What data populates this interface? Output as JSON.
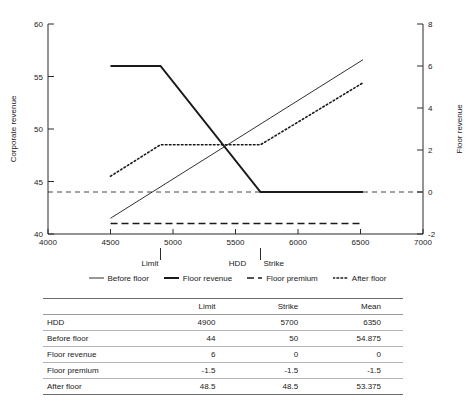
{
  "chart_data": {
    "type": "line",
    "title": "",
    "xlabel": "HDD",
    "ylabel": "Corporate revenue",
    "y2label": "Floor revenue",
    "xlim": [
      4000,
      7000
    ],
    "ylim": [
      40,
      60
    ],
    "y2lim": [
      -2,
      8
    ],
    "xticks": [
      4000,
      4500,
      5000,
      5500,
      6000,
      6500,
      7000
    ],
    "yticks": [
      40,
      45,
      50,
      55,
      60
    ],
    "y2ticks": [
      -2,
      0,
      2,
      4,
      6,
      8
    ],
    "grid": false,
    "legend_position": "below",
    "annotations": [
      {
        "name": "limit-marker",
        "label": "Limit",
        "x": 4900
      },
      {
        "name": "strike-marker",
        "label": "Strike",
        "x": 5700
      }
    ],
    "reference_lines": [
      {
        "name": "zero-floor-revenue",
        "axis": "y2",
        "value": 0,
        "style": "dashed"
      }
    ],
    "series": [
      {
        "name": "Before floor",
        "axis": "y",
        "style": "solid-thin",
        "x": [
          4500,
          6520
        ],
        "values": [
          41.5,
          56.6
        ]
      },
      {
        "name": "Floor revenue",
        "axis": "y2",
        "style": "solid-thick",
        "x": [
          4500,
          4900,
          5700,
          6520
        ],
        "values": [
          6,
          6,
          0,
          0
        ]
      },
      {
        "name": "Floor premium",
        "axis": "y2",
        "style": "dashed",
        "x": [
          4500,
          6520
        ],
        "values": [
          -1.5,
          -1.5
        ]
      },
      {
        "name": "After floor",
        "axis": "y",
        "style": "dotted",
        "x": [
          4500,
          4900,
          5700,
          6520
        ],
        "values": [
          45.5,
          48.5,
          48.5,
          54.4
        ]
      }
    ]
  },
  "legend": {
    "items": [
      {
        "label": "Before floor",
        "style": "solid-thin"
      },
      {
        "label": "Floor revenue",
        "style": "solid-thick"
      },
      {
        "label": "Floor premium",
        "style": "dashed"
      },
      {
        "label": "After floor",
        "style": "dotted"
      }
    ]
  },
  "table": {
    "columns": [
      "",
      "Limit",
      "Strike",
      "Mean"
    ],
    "rows": [
      {
        "label": "HDD",
        "values": [
          "4900",
          "5700",
          "6350"
        ]
      },
      {
        "label": "Before floor",
        "values": [
          "44",
          "50",
          "54.875"
        ]
      },
      {
        "label": "Floor revenue",
        "values": [
          "6",
          "0",
          "0"
        ]
      },
      {
        "label": "Floor premium",
        "values": [
          "-1.5",
          "-1.5",
          "-1.5"
        ]
      },
      {
        "label": "After floor",
        "values": [
          "48.5",
          "48.5",
          "53.375"
        ]
      }
    ]
  },
  "colors": {
    "ink": "#1a1a1a",
    "axis": "#2b2b2b",
    "rule": "#6e6e6e",
    "background": "#ffffff"
  }
}
